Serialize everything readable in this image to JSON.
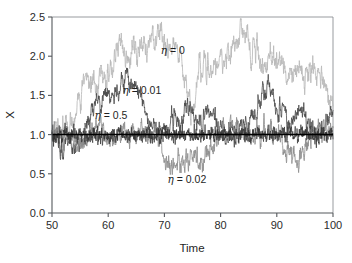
{
  "chart_data": {
    "type": "line",
    "title": "",
    "xlabel": "Time",
    "ylabel": "X",
    "xlim": [
      50,
      100
    ],
    "ylim": [
      0.0,
      2.5
    ],
    "xticks": [
      50,
      60,
      70,
      80,
      90,
      100
    ],
    "xtick_labels": [
      "50",
      "60",
      "70",
      "80",
      "90",
      "100"
    ],
    "yticks": [
      0.0,
      0.5,
      1.0,
      1.5,
      2.0,
      2.5
    ],
    "ytick_labels": [
      "0.0",
      "0.5",
      "1.0",
      "1.5",
      "2.0",
      "2.5"
    ],
    "grid": false,
    "legend_position": "inline-annotations",
    "reference_line": {
      "orientation": "horizontal",
      "value": 1.0,
      "color": "#000000",
      "label": "X = 1"
    },
    "series": [
      {
        "name": "eta = 0",
        "eta": 0,
        "color": "#b9b9b9",
        "width": 0.85,
        "seed": 1771,
        "reversion": 0.0,
        "volatility": 0.058,
        "start": 1.0,
        "annotation": "η = 0",
        "annotation_x": 71.5,
        "annotation_y": 2.03,
        "peak_value": 2.35,
        "peak_time": 69,
        "min_value": 0.62,
        "description": "Undamped random walk with the widest excursions, rising above 2.0 near t=62-70 and again near t=84."
      },
      {
        "name": "eta = 0.01",
        "eta": 0.01,
        "color": "#4a4a4a",
        "width": 0.8,
        "seed": 4409,
        "reversion": 0.012,
        "volatility": 0.05,
        "start": 1.0,
        "annotation": "η = 0.01",
        "annotation_x": 66.0,
        "annotation_y": 1.52,
        "peak_value": 1.72,
        "peak_time": 64,
        "min_value": 0.66,
        "description": "Weakly damped walk peaking near 1.7 around t=64 and near 1.55 around t=88."
      },
      {
        "name": "eta = 0.02",
        "eta": 0.02,
        "color": "#8f8f8f",
        "width": 0.85,
        "seed": 9203,
        "reversion": 0.02,
        "volatility": 0.052,
        "start": 1.0,
        "annotation": "η = 0.02",
        "annotation_x": 74.0,
        "annotation_y": 0.38,
        "peak_value": 1.38,
        "peak_time": 77,
        "min_value": 0.5,
        "description": "Moderately damped walk dipping to about 0.5 near t=71 and again near t=93."
      },
      {
        "name": "eta = 0.5",
        "eta": 0.5,
        "color": "#333333",
        "width": 0.7,
        "seed": 6127,
        "reversion": 0.55,
        "volatility": 0.047,
        "start": 1.0,
        "annotation": "η = 0.5",
        "annotation_x": 60.5,
        "annotation_y": 1.2,
        "peak_value": 1.12,
        "peak_time": 56,
        "min_value": 0.88,
        "description": "Strongly damped noise pinned tightly around X = 1.0 across the whole window."
      }
    ]
  },
  "figure": {
    "background_color": "#ffffff",
    "axis_color": "#55585c",
    "frame_color": "#8d9094",
    "axis_label_x": "Time",
    "axis_label_y": "X"
  }
}
